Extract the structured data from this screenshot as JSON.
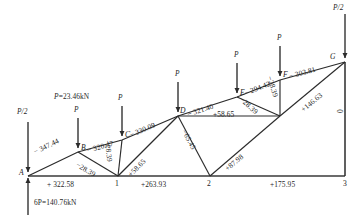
{
  "diagram": {
    "load_note": "P=23.46kN",
    "reaction_note": "6P=140.76kN",
    "half_load_left": "P/2",
    "half_load_right": "P/2",
    "point_loads": [
      "P",
      "P",
      "P",
      "P",
      "P"
    ],
    "line_color": "#2b2b2b",
    "text_color": "#1f1f1f"
  },
  "nodes": {
    "top": [
      {
        "id": "A",
        "label": "A"
      },
      {
        "id": "B",
        "label": "B"
      },
      {
        "id": "C",
        "label": "C"
      },
      {
        "id": "D",
        "label": "D"
      },
      {
        "id": "E",
        "label": "E"
      },
      {
        "id": "F",
        "label": "F"
      },
      {
        "id": "G",
        "label": "G"
      }
    ],
    "bottom": [
      {
        "id": "n1",
        "label": "1"
      },
      {
        "id": "n2",
        "label": "2"
      },
      {
        "id": "n3",
        "label": "3"
      }
    ]
  },
  "members": {
    "top_chord": [
      {
        "name": "A-B",
        "value": "− 347.44"
      },
      {
        "name": "B-C",
        "value": "− 320.47"
      },
      {
        "name": "C-D",
        "value": "− 330.09"
      },
      {
        "name": "D-E",
        "value": "− 321.40"
      },
      {
        "name": "E-F",
        "value": "− 294.42"
      },
      {
        "name": "F-G",
        "value": "− 303.81"
      }
    ],
    "bottom_chord": [
      {
        "name": "A-1",
        "value": "+ 322.58"
      },
      {
        "name": "1-2",
        "value": "+263.93"
      },
      {
        "name": "2-3",
        "value": "+175.95"
      }
    ],
    "web": [
      {
        "name": "B-1",
        "value": "−28.39"
      },
      {
        "name": "C-1",
        "value": "−28.39"
      },
      {
        "name": "1-D",
        "value": "+58.65"
      },
      {
        "name": "D-H",
        "value": "+58.65"
      },
      {
        "name": "D-2",
        "value": "−65.45"
      },
      {
        "name": "E-H",
        "value": "−28.39"
      },
      {
        "name": "2-H",
        "value": "+87.98"
      },
      {
        "name": "F-H",
        "value": "−28.39"
      },
      {
        "name": "H-G",
        "value": "+146.63"
      },
      {
        "name": "G-3",
        "value": "0"
      }
    ]
  }
}
